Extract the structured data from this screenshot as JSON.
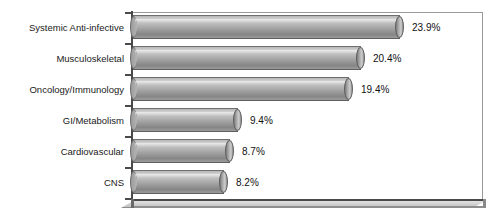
{
  "chart_data": {
    "type": "bar",
    "orientation": "horizontal",
    "title": "",
    "xlabel": "",
    "ylabel": "",
    "grid": false,
    "legend": false,
    "xlim": [
      0,
      26
    ],
    "categories": [
      "Systemic Anti-infective",
      "Musculoskeletal",
      "Oncology/Immunology",
      "GI/Metabolism",
      "Cardiovascular",
      "CNS"
    ],
    "values": [
      23.9,
      20.4,
      19.4,
      9.4,
      8.7,
      8.2
    ],
    "value_labels": [
      "23.9%",
      "20.4%",
      "19.4%",
      "9.4%",
      "8.7%",
      "8.2%"
    ]
  },
  "style": {
    "bar_fill_light": "#d2d2d2",
    "bar_fill_dark": "#868686",
    "axis_color": "#4a4a4a",
    "border_color": "#9a9a9a",
    "background": "#ffffff",
    "text_color": "#1a1a1a"
  }
}
